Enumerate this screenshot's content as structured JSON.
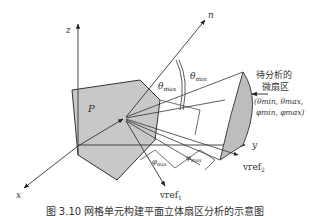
{
  "figure": {
    "axes": {
      "x": "x",
      "y": "y",
      "z": "z"
    },
    "normal_label": "n",
    "plane_label": "P",
    "theta_max_label": {
      "base": "θ",
      "sub": "max"
    },
    "theta_min_label": {
      "base": "θ",
      "sub": "min"
    },
    "phi_min_label": {
      "base": "φ",
      "sub": "min"
    },
    "phi_max_label": {
      "base": "φ",
      "sub": "max"
    },
    "vref1_label": {
      "base": "vref",
      "sub": "1"
    },
    "vref2_label": {
      "base": "vref",
      "sub": "2"
    },
    "region_title_line1": "待分析的",
    "region_title_line2": "微扇区",
    "region_params_line1": "(θmin, θmax,",
    "region_params_line2": "φmin, φmax)",
    "colors": {
      "plane_fill": "#c8c8c8",
      "sector_fill": "#bdbdbd",
      "line": "#333333"
    }
  },
  "caption": "图 3.10  网格单元构建平面立体扇区分析的示意图"
}
